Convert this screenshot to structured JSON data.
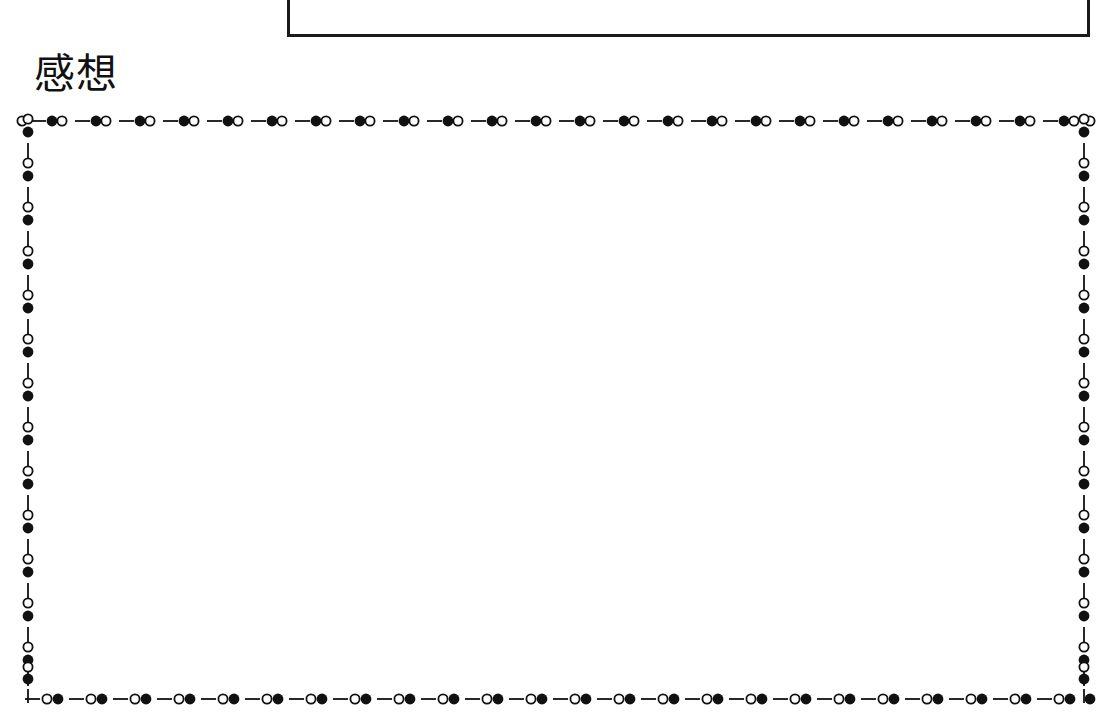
{
  "document": {
    "background_color": "#ffffff",
    "ink_color": "#111111",
    "width": 1103,
    "height": 727
  },
  "top_box": {
    "name": "previous-section-box",
    "description": "bottom portion of a bordered rectangle cut off by the top of the page",
    "border_color": "#1a1a1a",
    "border_width_px": 3,
    "left": 287,
    "right": 1090,
    "bottom": 37
  },
  "section": {
    "heading": "感想",
    "heading_reading": "kansou",
    "heading_font_size_px": 41
  },
  "frame": {
    "name": "decorative-dot-dash-border",
    "color": "#111111",
    "left": 22,
    "top": 115,
    "width": 1068,
    "height": 590,
    "motif_period_px": 44,
    "filled_circle_radius_px": 5.4,
    "open_circle_radius_px": 4.6,
    "open_circle_stroke_px": 1.8,
    "dash_length_px": 15,
    "dash_thickness_px": 1.8,
    "horizontal_motif_order": [
      "dash",
      "filled-circle",
      "open-circle"
    ],
    "bottom_motif_order": [
      "dash",
      "open-circle",
      "filled-circle"
    ],
    "vertical_motif_order": [
      "open-circle",
      "filled-circle",
      "dash"
    ],
    "top_repeats": 24,
    "bottom_repeats": 24,
    "left_repeats": 13,
    "right_repeats": 13
  },
  "writing_area": {
    "name": "free-response-writing-area",
    "content": "",
    "is_blank": true
  }
}
